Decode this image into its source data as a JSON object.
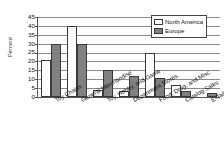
{
  "chart_data": {
    "type": "bar",
    "title": "",
    "subtitle": "",
    "xlabel": "",
    "ylabel": "Percent",
    "ylim": [
      0,
      45
    ],
    "ytick_step": 5,
    "yticks": [
      0,
      5,
      10,
      15,
      20,
      25,
      30,
      35,
      40,
      45
    ],
    "grid": true,
    "grid_axis": "y",
    "legend_position": "top-right",
    "categories": [
      "Toy Chains",
      "General Merchandise",
      "Toy, Hobby, and Game",
      "Department Stores",
      "Food, Drug, and Misc.",
      "Catalog Sales",
      "E-Tailers"
    ],
    "series": [
      {
        "name": "North America",
        "color": "#ffffff",
        "values": [
          21,
          40,
          4,
          3.5,
          25,
          6.5,
          0
        ]
      },
      {
        "name": "Europe",
        "color": "#808080",
        "values": [
          30,
          30,
          15,
          12,
          10.5,
          3.5,
          2
        ]
      }
    ]
  },
  "axes": {
    "y_title": "Percent"
  },
  "legend": {
    "entries": [
      {
        "label": "North America",
        "swatch": "north-america-swatch"
      },
      {
        "label": "Europe",
        "swatch": "europe-swatch"
      }
    ]
  }
}
